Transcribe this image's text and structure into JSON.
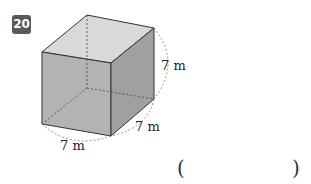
{
  "problem": {
    "number": "20",
    "shape": "cube",
    "dimensions": {
      "height_label": "7 m",
      "depth_label": "7 m",
      "width_label": "7 m"
    },
    "answer_box": {
      "open": "(",
      "close": ")",
      "value": ""
    }
  },
  "colors": {
    "badge": "#5a5a5a",
    "top_face": "#d9d9d9",
    "front_face": "#b3b3b3",
    "side_face": "#a0a0a0",
    "edge": "#333333"
  }
}
